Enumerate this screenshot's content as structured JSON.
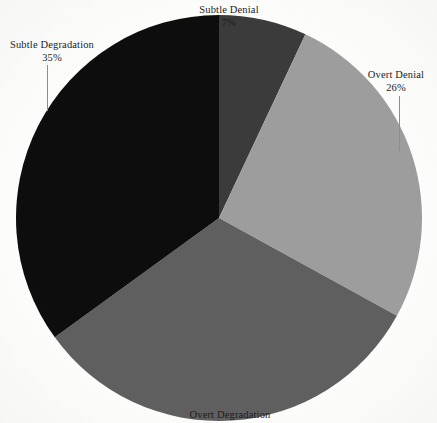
{
  "chart_data": {
    "type": "pie",
    "title": "",
    "subtitle": "",
    "xlabel": "",
    "ylabel": "",
    "grid": false,
    "legend_position": "none",
    "label_style": "outside-with-leader-lines",
    "start_angle_deg": 0,
    "direction": "clockwise",
    "units": "percent",
    "total": 100,
    "categories": [
      "Subtle Denial",
      "Overt Denial",
      "Overt Degradation",
      "Subtle Degradation"
    ],
    "values": [
      7,
      26,
      32,
      35
    ],
    "colors": [
      "#3a3a3a",
      "#9d9d9d",
      "#5e5e5e",
      "#0d0d0d"
    ],
    "slices": [
      {
        "label": "Subtle Denial",
        "value": 7,
        "value_text": "7%",
        "color": "#3a3a3a",
        "start_deg": 0,
        "end_deg": 25.2
      },
      {
        "label": "Overt Denial",
        "value": 26,
        "value_text": "26%",
        "color": "#9d9d9d",
        "start_deg": 25.2,
        "end_deg": 118.8
      },
      {
        "label": "Overt Degradation",
        "value": 32,
        "value_text": "",
        "color": "#5e5e5e",
        "start_deg": 118.8,
        "end_deg": 234.0
      },
      {
        "label": "Subtle Degradation",
        "value": 35,
        "value_text": "35%",
        "color": "#0d0d0d",
        "start_deg": 234.0,
        "end_deg": 360.0
      }
    ]
  },
  "labels": {
    "subtle_denial": {
      "name": "Subtle Denial",
      "value": "7%"
    },
    "overt_denial": {
      "name": "Overt Denial",
      "value": "26%"
    },
    "overt_degradation": {
      "name": "Overt Degradation",
      "value": ""
    },
    "subtle_degradation": {
      "name": "Subtle Degradation",
      "value": "35%"
    }
  },
  "geometry": {
    "center_x": 219,
    "center_y": 218,
    "radius": 203
  },
  "palette": {
    "background": "#fdfdfb",
    "text": "#1b1b1b",
    "leader_line": "#8d8d8d",
    "slice_subtle_denial": "#3a3a3a",
    "slice_overt_denial": "#9d9d9d",
    "slice_overt_degradation": "#5e5e5e",
    "slice_subtle_degradation": "#0d0d0d"
  }
}
